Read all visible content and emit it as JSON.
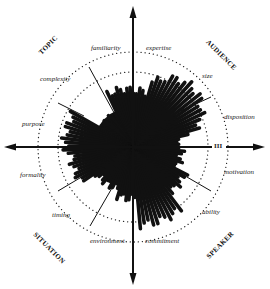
{
  "diagram": {
    "center": [
      133,
      147
    ],
    "outer_ring_radius": 95,
    "inner_ring_radius": 75,
    "ink_color": "#111111",
    "quadrants": [
      {
        "key": "topic",
        "label": "TOPIC"
      },
      {
        "key": "audience",
        "label": "AUDIENCE"
      },
      {
        "key": "speaker",
        "label": "SPEAKER"
      },
      {
        "key": "situation",
        "label": "SITUATION"
      }
    ],
    "dimensions": [
      {
        "label": "familiarity"
      },
      {
        "label": "expertise"
      },
      {
        "label": "size"
      },
      {
        "label": "disposition"
      },
      {
        "label": "motivation"
      },
      {
        "label": "ability"
      },
      {
        "label": "commitment"
      },
      {
        "label": "environment"
      },
      {
        "label": "timing"
      },
      {
        "label": "formality"
      },
      {
        "label": "purpose"
      },
      {
        "label": "complexity"
      }
    ],
    "axis_marker": "III"
  }
}
